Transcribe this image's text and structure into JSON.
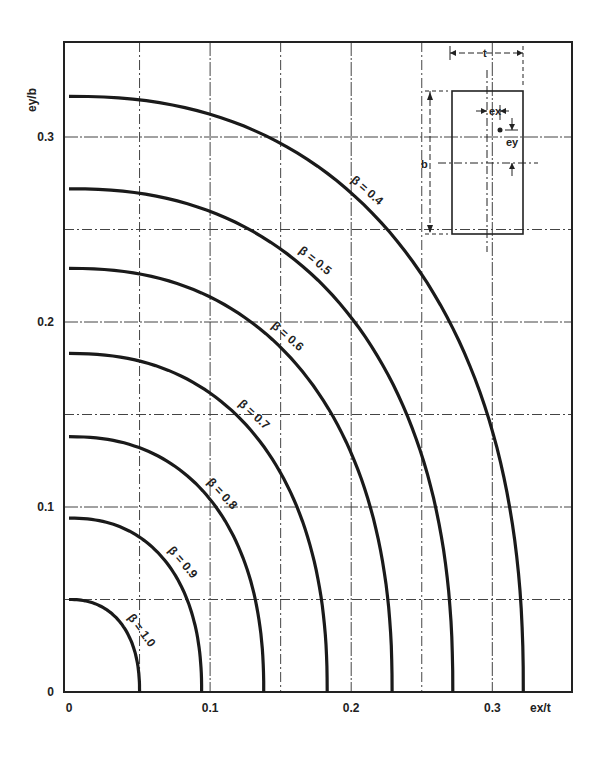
{
  "chart_data": {
    "type": "line",
    "title": "",
    "xlabel": "ex/t",
    "ylabel": "ey/b",
    "xlim": [
      0,
      0.35
    ],
    "ylim": [
      0,
      0.35
    ],
    "grid": true,
    "x_ticks": [
      {
        "value": 0,
        "label": "0"
      },
      {
        "value": 0.1,
        "label": "0.1"
      },
      {
        "value": 0.2,
        "label": "0.2"
      },
      {
        "value": 0.3,
        "label": "0.3"
      }
    ],
    "y_ticks": [
      {
        "value": 0,
        "label": "0"
      },
      {
        "value": 0.1,
        "label": "0.1"
      },
      {
        "value": 0.2,
        "label": "0.2"
      },
      {
        "value": 0.3,
        "label": "0.3"
      }
    ],
    "gridlines_x": [
      0.05,
      0.1,
      0.15,
      0.2,
      0.25,
      0.3
    ],
    "gridlines_y": [
      0.05,
      0.1,
      0.15,
      0.2,
      0.25,
      0.3
    ],
    "series": [
      {
        "name": "β = 0.4",
        "label": "β = 0.4",
        "x_intercept": 0.322,
        "y_intercept": 0.322,
        "label_at": 0.38
      },
      {
        "name": "β = 0.5",
        "label": "β = 0.5",
        "x_intercept": 0.272,
        "y_intercept": 0.272,
        "label_at": 0.36
      },
      {
        "name": "β = 0.6",
        "label": "β = 0.6",
        "x_intercept": 0.229,
        "y_intercept": 0.229,
        "label_at": 0.38
      },
      {
        "name": "β = 0.7",
        "label": "β = 0.7",
        "x_intercept": 0.183,
        "y_intercept": 0.183,
        "label_at": 0.4
      },
      {
        "name": "β = 0.8",
        "label": "β = 0.8",
        "x_intercept": 0.138,
        "y_intercept": 0.138,
        "label_at": 0.44
      },
      {
        "name": "β = 0.9",
        "label": "β = 0.9",
        "x_intercept": 0.094,
        "y_intercept": 0.094,
        "label_at": 0.46
      },
      {
        "name": "β = 1.0",
        "label": "β = 1.0",
        "x_intercept": 0.05,
        "y_intercept": 0.05,
        "label_at": 0.5
      }
    ],
    "curve_shape": "quarter superellipse (exponent ~2.3) between axis intercepts",
    "inset": {
      "description": "Rectangular column section with eccentric load point",
      "labels": {
        "width": "t",
        "height": "b",
        "ecc_x": "ex",
        "ecc_y": "ey"
      }
    }
  }
}
